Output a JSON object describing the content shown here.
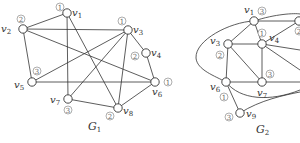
{
  "figure": {
    "graphs": [
      {
        "name": "G",
        "subscript": "1",
        "label_pos": [
          88,
          130
        ],
        "vertices": [
          {
            "id": "v1",
            "sub": "1",
            "x": 67,
            "y": 13,
            "color": "1",
            "label_dx": 5,
            "label_dy": 3,
            "color_dx": -7,
            "color_dy": -6
          },
          {
            "id": "v2",
            "sub": "2",
            "x": 23,
            "y": 29,
            "color": "2",
            "label_dx": -22,
            "label_dy": 3,
            "color_dx": -2,
            "color_dy": -10
          },
          {
            "id": "v3",
            "sub": "3",
            "x": 128,
            "y": 30,
            "color": "1",
            "label_dx": 5,
            "label_dy": 3,
            "color_dx": -6,
            "color_dy": -9
          },
          {
            "id": "v4",
            "sub": "4",
            "x": 146,
            "y": 53,
            "color": "2",
            "label_dx": 5,
            "label_dy": 3,
            "color_dx": -11,
            "color_dy": 3
          },
          {
            "id": "v5",
            "sub": "5",
            "x": 32,
            "y": 82,
            "color": "3",
            "label_dx": -18,
            "label_dy": 6,
            "color_dx": 5,
            "color_dy": -11
          },
          {
            "id": "v6",
            "sub": "6",
            "x": 155,
            "y": 82,
            "color": "1",
            "label_dx": -3,
            "label_dy": 13,
            "color_dx": 13,
            "color_dy": 0
          },
          {
            "id": "v7",
            "sub": "7",
            "x": 68,
            "y": 99,
            "color": "3",
            "label_dx": -18,
            "label_dy": 4,
            "color_dx": 0,
            "color_dy": 11
          },
          {
            "id": "v8",
            "sub": "8",
            "x": 118,
            "y": 108,
            "color": "2",
            "label_dx": 5,
            "label_dy": 6,
            "color_dx": -8,
            "color_dy": 8
          }
        ],
        "edges": [
          [
            "v1",
            "v2"
          ],
          [
            "v2",
            "v3"
          ],
          [
            "v2",
            "v5"
          ],
          [
            "v2",
            "v6"
          ],
          [
            "v1",
            "v7"
          ],
          [
            "v1",
            "v8"
          ],
          [
            "v3",
            "v5"
          ],
          [
            "v3",
            "v7"
          ],
          [
            "v3",
            "v8"
          ],
          [
            "v3",
            "v4"
          ],
          [
            "v4",
            "v6"
          ],
          [
            "v5",
            "v6"
          ],
          [
            "v7",
            "v8"
          ],
          [
            "v8",
            "v6"
          ]
        ],
        "curves": []
      },
      {
        "name": "G",
        "subscript": "2",
        "label_pos": [
          256,
          133
        ],
        "vertices": [
          {
            "id": "v1",
            "sub": "1",
            "x": 254,
            "y": 21,
            "color": "3",
            "label_dx": -10,
            "label_dy": -8,
            "color_dx": 8,
            "color_dy": -10
          },
          {
            "id": "v2",
            "sub": "2",
            "x": 299,
            "y": 21,
            "color": "2",
            "label_dx": 8,
            "label_dy": 3,
            "color_dx": 0,
            "color_dy": 10
          },
          {
            "id": "v3",
            "sub": "3",
            "x": 228,
            "y": 44,
            "color": "2",
            "label_dx": -18,
            "label_dy": 0,
            "color_dx": -8,
            "color_dy": 11
          },
          {
            "id": "v4",
            "sub": "4",
            "x": 262,
            "y": 44,
            "color": "1",
            "label_dx": 7,
            "label_dy": -3,
            "color_dx": 0,
            "color_dy": -11
          },
          {
            "id": "v6",
            "sub": "6",
            "x": 226,
            "y": 82,
            "color": "1",
            "label_dx": -16,
            "label_dy": 8,
            "color_dx": -2,
            "color_dy": 15
          },
          {
            "id": "v7",
            "sub": "7",
            "x": 262,
            "y": 82,
            "color": "3",
            "label_dx": -5,
            "label_dy": 14,
            "color_dx": 8,
            "color_dy": -8
          },
          {
            "id": "v9",
            "sub": "9",
            "x": 240,
            "y": 113,
            "color": "3",
            "label_dx": 6,
            "label_dy": 4,
            "color_dx": -11,
            "color_dy": 4
          }
        ],
        "edges": [
          [
            "v1",
            "v3"
          ],
          [
            "v1",
            "v4"
          ],
          [
            "v1",
            "v2"
          ],
          [
            "v3",
            "v4"
          ],
          [
            "v3",
            "v6"
          ],
          [
            "v3",
            "v7"
          ],
          [
            "v4",
            "v7"
          ],
          [
            "v4",
            "v2"
          ],
          [
            "v6",
            "v7"
          ],
          [
            "v6",
            "v9"
          ]
        ],
        "extra_lines": [
          [
            262,
            44,
            300,
            70
          ],
          [
            262,
            82,
            300,
            82
          ],
          [
            262,
            44,
            300,
            50
          ]
        ],
        "curves": [
          "M 254 21 C 230 22, 195 40, 196 58 C 197 70, 215 76, 226 82",
          "M 254 21 C 275 14, 295 13, 300 14",
          "M 226 82 C 240 100, 270 102, 300 90",
          "M 240 113 C 260 100, 285 95, 300 92"
        ]
      }
    ]
  }
}
